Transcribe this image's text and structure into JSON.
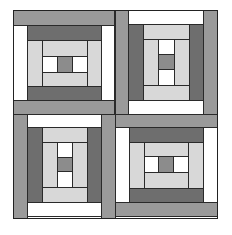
{
  "colors": {
    "dark": "#6e6e6e",
    "medium": "#9a9a9a",
    "light": "#d8d8d8",
    "white": "#ffffff",
    "center": "#8c8c8c",
    "outline": "#222222"
  },
  "blocks": [
    {
      "position": "top-left",
      "orientation": "horizontal"
    },
    {
      "position": "top-right",
      "orientation": "vertical"
    },
    {
      "position": "bottom-left",
      "orientation": "vertical"
    },
    {
      "position": "bottom-right",
      "orientation": "horizontal"
    }
  ]
}
